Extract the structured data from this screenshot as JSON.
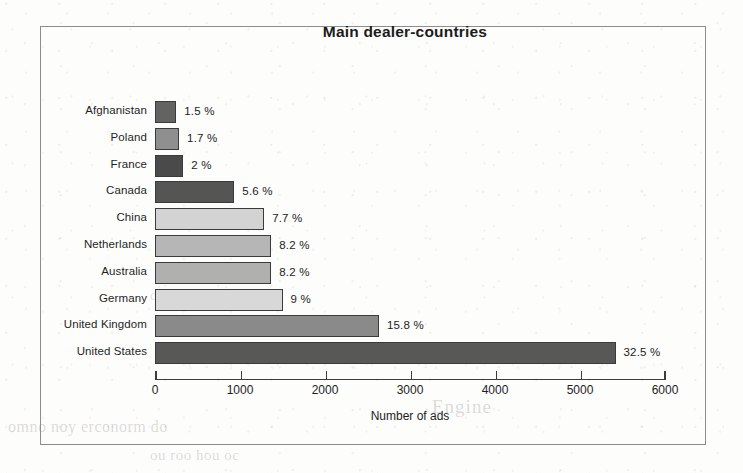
{
  "chart_data": {
    "type": "bar",
    "orientation": "horizontal",
    "title": "Main dealer-countries",
    "xlabel": "Number of ads",
    "ylabel": "",
    "xlim": [
      0,
      6000
    ],
    "xticks": [
      0,
      1000,
      2000,
      3000,
      4000,
      5000,
      6000
    ],
    "xtick_labels": [
      "0",
      "1000",
      "2000",
      "3000",
      "4000",
      "5000",
      "6000"
    ],
    "grid": false,
    "legend": false,
    "categories": [
      "Afghanistan",
      "Poland",
      "France",
      "Canada",
      "China",
      "Netherlands",
      "Australia",
      "Germany",
      "United Kingdom",
      "United States"
    ],
    "values": [
      250,
      283,
      333,
      933,
      1284,
      1367,
      1367,
      1500,
      2634,
      5418
    ],
    "data_labels": [
      "1.5 %",
      "1.7 %",
      "2 %",
      "5.6 %",
      "7.7 %",
      "8.2 %",
      "8.2 %",
      "9 %",
      "15.8 %",
      "32.5 %"
    ],
    "percents": [
      1.5,
      1.7,
      2,
      5.6,
      7.7,
      8.2,
      8.2,
      9,
      15.8,
      32.5
    ],
    "bar_colors": [
      "#636363",
      "#8f8f8f",
      "#4a4a4a",
      "#555555",
      "#d3d3d3",
      "#b6b6b6",
      "#b0b0b0",
      "#d8d8d8",
      "#8a8a8a",
      "#585858"
    ],
    "bar_border_color": "#3b3b3b",
    "bars": [
      {
        "category": "Afghanistan",
        "value": 250,
        "label": "1.5 %",
        "color": "#636363"
      },
      {
        "category": "Poland",
        "value": 283,
        "label": "1.7 %",
        "color": "#8f8f8f"
      },
      {
        "category": "France",
        "value": 333,
        "label": "2 %",
        "color": "#4a4a4a"
      },
      {
        "category": "Canada",
        "value": 933,
        "label": "5.6 %",
        "color": "#555555"
      },
      {
        "category": "China",
        "value": 1284,
        "label": "7.7 %",
        "color": "#d3d3d3"
      },
      {
        "category": "Netherlands",
        "value": 1367,
        "label": "8.2 %",
        "color": "#b6b6b6"
      },
      {
        "category": "Australia",
        "value": 1367,
        "label": "8.2 %",
        "color": "#b0b0b0"
      },
      {
        "category": "Germany",
        "value": 1500,
        "label": "9 %",
        "color": "#d8d8d8"
      },
      {
        "category": "United Kingdom",
        "value": 2634,
        "label": "15.8 %",
        "color": "#8a8a8a"
      },
      {
        "category": "United States",
        "value": 5418,
        "label": "32.5 %",
        "color": "#585858"
      }
    ]
  },
  "page_artifacts": {
    "ghost_line_a": "Engine",
    "ghost_line_b": "omno noy erconorm do",
    "ghost_line_c": "ou roo hou oc",
    "ghost_line_d": "coo no"
  }
}
